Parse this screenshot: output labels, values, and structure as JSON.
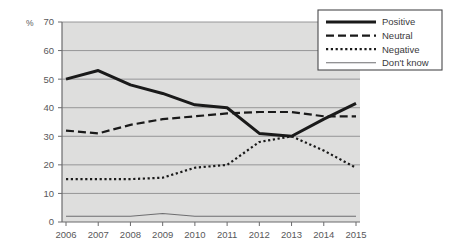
{
  "chart_data": {
    "type": "line",
    "title": "",
    "xlabel": "",
    "ylabel": "%",
    "ylim": [
      0,
      70
    ],
    "ytick_step": 10,
    "yticks": [
      0,
      10,
      20,
      30,
      40,
      50,
      60,
      70
    ],
    "grid": true,
    "legend_position": "top-right",
    "categories": [
      "2006",
      "2007",
      "2008",
      "2009",
      "2010",
      "2011",
      "2012",
      "2013",
      "2014",
      "2015"
    ],
    "series": [
      {
        "name": "Positive",
        "style": "solid-thick",
        "color": "#1a1a1a",
        "values": [
          50,
          53,
          48,
          45,
          41,
          40,
          31,
          30,
          36,
          41.5
        ]
      },
      {
        "name": "Neutral",
        "style": "dashed",
        "color": "#1a1a1a",
        "values": [
          32,
          31,
          34,
          36,
          37,
          38,
          38.5,
          38.5,
          37,
          37
        ]
      },
      {
        "name": "Negative",
        "style": "dotted",
        "color": "#1a1a1a",
        "values": [
          15,
          15,
          15,
          15.5,
          19,
          20,
          28,
          30,
          25,
          19
        ]
      },
      {
        "name": "Don't know",
        "style": "solid-thin",
        "color": "#6e6e70",
        "values": [
          2,
          2,
          2,
          3,
          2,
          2,
          2,
          2,
          2,
          2
        ]
      }
    ]
  },
  "axes": {
    "percent_label": "%",
    "y_tick_labels": [
      "70",
      "60",
      "50",
      "40",
      "30",
      "20",
      "10",
      "0"
    ],
    "x_tick_labels": [
      "2006",
      "2007",
      "2008",
      "2009",
      "2010",
      "2011",
      "2012",
      "2013",
      "2014",
      "2015"
    ]
  },
  "legend": {
    "entries": [
      {
        "label": "Positive",
        "style": "solid-thick"
      },
      {
        "label": "Neutral",
        "style": "dashed"
      },
      {
        "label": "Negative",
        "style": "dotted"
      },
      {
        "label": "Don't know",
        "style": "solid-thin"
      }
    ]
  },
  "colors": {
    "plot_background": "#dededd",
    "gridline": "#8d8d8f",
    "axis": "#6b6b6d",
    "series_dark": "#1a1a1a",
    "series_light": "#6e6e70",
    "legend_background": "#ffffff",
    "legend_border": "#4a4a4c",
    "text": "#58585a"
  }
}
